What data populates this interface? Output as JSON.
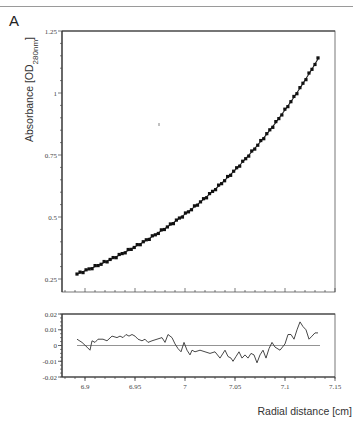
{
  "panel_label": "A",
  "chart_data": [
    {
      "type": "scatter",
      "title": "",
      "xlabel": "",
      "ylabel": "Absorbance [OD280nm]",
      "ylabel_main": "Absorbance [OD",
      "ylabel_sub": "280nm",
      "ylabel_end": "]",
      "xlim": [
        6.877,
        7.15
      ],
      "ylim": [
        0.197,
        1.25
      ],
      "yticks": [
        "1.25",
        "1",
        "0.75",
        "0.5",
        "0.25"
      ],
      "ytick_values": [
        1.25,
        1.0,
        0.75,
        0.5,
        0.25
      ],
      "grid": false,
      "series": [
        {
          "name": "data",
          "marker": "square",
          "x": [
            6.892,
            6.902,
            6.912,
            6.922,
            6.932,
            6.942,
            6.952,
            6.962,
            6.972,
            6.982,
            6.992,
            7.002,
            7.012,
            7.022,
            7.032,
            7.042,
            7.052,
            7.062,
            7.072,
            7.082,
            7.092,
            7.102,
            7.112,
            7.122,
            7.133
          ],
          "values": [
            0.27,
            0.289,
            0.31,
            0.331,
            0.353,
            0.377,
            0.401,
            0.427,
            0.455,
            0.484,
            0.514,
            0.546,
            0.58,
            0.616,
            0.654,
            0.694,
            0.737,
            0.782,
            0.83,
            0.88,
            0.933,
            0.99,
            1.05,
            1.112,
            1.137
          ]
        },
        {
          "name": "fit",
          "type": "line"
        }
      ]
    },
    {
      "type": "line",
      "title": "",
      "xlabel": "Radial distance [cm]",
      "ylabel": "",
      "xlim": [
        6.877,
        7.15
      ],
      "ylim": [
        -0.02,
        0.02
      ],
      "xticks": [
        "6.9",
        "6.95",
        "7",
        "7.05",
        "7.1",
        "7.15"
      ],
      "xtick_values": [
        6.9,
        6.95,
        7.0,
        7.05,
        7.1,
        7.15
      ],
      "yticks": [
        "0.02",
        "0.01",
        "0",
        "-0.01",
        "-0.02"
      ],
      "ytick_values": [
        0.02,
        0.01,
        0.0,
        -0.01,
        -0.02
      ],
      "grid": false,
      "series": [
        {
          "name": "residuals",
          "x": [
            6.892,
            6.897,
            6.902,
            6.905,
            6.907,
            6.91,
            6.913,
            6.918,
            6.922,
            6.927,
            6.932,
            6.935,
            6.938,
            6.941,
            6.944,
            6.947,
            6.95,
            6.953,
            6.957,
            6.96,
            6.963,
            6.967,
            6.972,
            6.977,
            6.98,
            6.983,
            6.987,
            6.99,
            6.993,
            6.996,
            6.999,
            7.002,
            7.005,
            7.007,
            7.01,
            7.015,
            7.02,
            7.025,
            7.03,
            7.035,
            7.04,
            7.043,
            7.046,
            7.048,
            7.051,
            7.054,
            7.057,
            7.06,
            7.063,
            7.066,
            7.069,
            7.072,
            7.075,
            7.078,
            7.081,
            7.084,
            7.087,
            7.09,
            7.095,
            7.1,
            7.103,
            7.106,
            7.109,
            7.112,
            7.115,
            7.118,
            7.121,
            7.124,
            7.127,
            7.13,
            7.133
          ],
          "values": [
            0.004,
            0.002,
            -0.001,
            -0.003,
            0.003,
            0.002,
            0.004,
            0.004,
            0.003,
            0.006,
            0.005,
            0.006,
            0.005,
            0.007,
            0.006,
            0.007,
            0.006,
            0.004,
            0.003,
            0.004,
            0.002,
            0.003,
            0.004,
            0.005,
            0.002,
            0.007,
            0.005,
            0.001,
            -0.002,
            -0.004,
            0.002,
            -0.003,
            -0.006,
            -0.003,
            -0.004,
            -0.003,
            -0.004,
            -0.005,
            -0.004,
            -0.008,
            -0.003,
            -0.007,
            -0.008,
            -0.01,
            -0.007,
            -0.004,
            -0.008,
            -0.006,
            -0.008,
            -0.005,
            -0.006,
            -0.011,
            -0.006,
            -0.003,
            -0.008,
            -0.002,
            0.002,
            -0.001,
            -0.003,
            0.001,
            0.007,
            0.007,
            0.004,
            0.01,
            0.015,
            0.012,
            0.01,
            0.004,
            0.006,
            0.008,
            0.008
          ]
        },
        {
          "name": "zero-line",
          "type": "hline",
          "y": 0
        }
      ]
    }
  ]
}
